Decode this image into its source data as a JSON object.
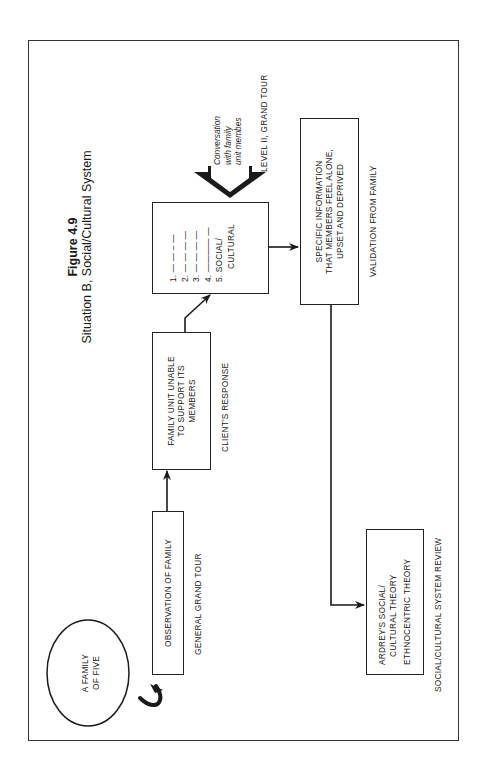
{
  "figure": {
    "number": "Figure 4.9",
    "caption": "Situation B, Social/Cultural System"
  },
  "nodes": {
    "family_oval": {
      "line1": "A FAMILY",
      "line2": "OF FIVE"
    },
    "observation": {
      "text": "OBSERVATION OF FAMILY",
      "label": "GENERAL GRAND TOUR"
    },
    "family_unit": {
      "line1": "FAMILY UNIT UNABLE",
      "line2": "TO SUPPORT ITS",
      "line3": "MEMBERS",
      "label": "CLIENT'S RESPONSE"
    },
    "checklist": {
      "items": [
        "1.  — — – —",
        "2.  — — — —",
        "3.  — — — —",
        "4.  ———— —",
        "5.  SOCIAL/"
      ],
      "item5_cont": "CULTURAL"
    },
    "conversation": {
      "line1": "Conversation",
      "line2": "with family",
      "line3": "unit membes",
      "label": "LEVEL II, GRAND TOUR"
    },
    "specific_info": {
      "line1": "SPECIFIC INFORMATION",
      "line2": "THAT MEMBERS FEEL ALONE,",
      "line3": "UPSET AND DEPRIVED",
      "label": "VALIDATION FROM FAMILY"
    },
    "theory": {
      "line1": "ARDREY'S SOCIAL/",
      "line2": "CULTURAL THEORY",
      "line3": "ETHNOCENTRIC THEORY",
      "label": "SOCIAL/CULTURAL SYSTEM REVIEW"
    }
  },
  "colors": {
    "ink": "#1a1a1a",
    "frame": "#333333",
    "background": "#ffffff"
  }
}
